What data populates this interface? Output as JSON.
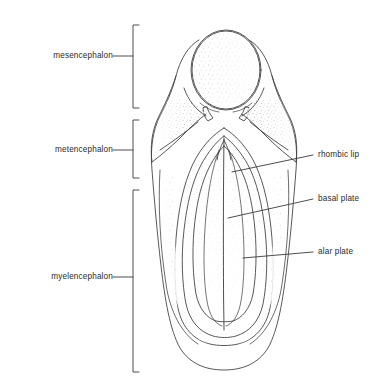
{
  "figure": {
    "background_color": "#ffffff",
    "ink_color": "#3a3a3a",
    "text_color": "#2b2b2b"
  },
  "left_labels": [
    {
      "id": "mesencephalon",
      "text": "mesencephalon",
      "text_x": 113,
      "text_y": 56,
      "tick_x1": 113,
      "tick_x2": 133,
      "bracket_top": 25,
      "bracket_bottom": 108
    },
    {
      "id": "metencephalon",
      "text": "metencephalon",
      "text_x": 113,
      "text_y": 150,
      "tick_x1": 113,
      "tick_x2": 133,
      "bracket_top": 120,
      "bracket_bottom": 178
    },
    {
      "id": "myelencephalon",
      "text": "myelencephalon",
      "text_x": 113,
      "text_y": 277,
      "tick_x1": 113,
      "tick_x2": 133,
      "bracket_top": 190,
      "bracket_bottom": 372
    }
  ],
  "right_labels": [
    {
      "id": "rhombic-lip",
      "text": "rhombic lip",
      "text_x": 318,
      "text_y": 155,
      "leader_x1": 313,
      "leader_y1": 155,
      "leader_x2": 232,
      "leader_y2": 172
    },
    {
      "id": "basal-plate",
      "text": "basal plate",
      "text_x": 318,
      "text_y": 199,
      "leader_x1": 313,
      "leader_y1": 199,
      "leader_x2": 228,
      "leader_y2": 218
    },
    {
      "id": "alar-plate",
      "text": "alar plate",
      "text_x": 318,
      "text_y": 252,
      "leader_x1": 313,
      "leader_y1": 252,
      "leader_x2": 243,
      "leader_y2": 258
    }
  ],
  "anatomy": {
    "mesencephalon_circle": {
      "cx": 226,
      "cy": 70,
      "r": 35
    },
    "midline_x": 224,
    "outer_outline_bottom_y": 368,
    "outer_outline_left_x": 155,
    "outer_outline_right_x": 285
  }
}
